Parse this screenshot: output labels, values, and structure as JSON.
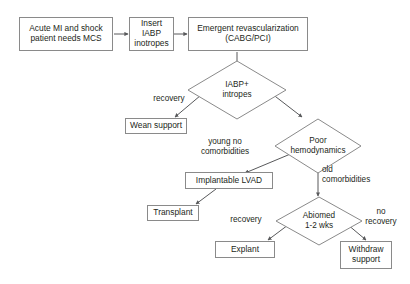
{
  "diagram": {
    "type": "flowchart",
    "colors": {
      "background": "#ffffff",
      "node_border": "#8a8a8a",
      "edge_stroke": "#58595b",
      "text": "#231f20"
    },
    "nodes": {
      "acute_mi": {
        "label": "Acute MI and shock\npatient needs MCS",
        "shape": "box"
      },
      "insert_iabp": {
        "label": "Insert IABP\ninotropes",
        "shape": "box"
      },
      "revascularization": {
        "label": "Emergent revascularization\n(CABG/PCI)",
        "shape": "box"
      },
      "iabp_inotropes_decision": {
        "label": "IABP+\nintropes",
        "shape": "diamond"
      },
      "wean_support": {
        "label": "Wean support",
        "shape": "box"
      },
      "poor_hemodynamics": {
        "label": "Poor\nhemodynamics",
        "shape": "diamond"
      },
      "implantable_lvad": {
        "label": "Implantable LVAD",
        "shape": "box"
      },
      "transplant": {
        "label": "Transplant",
        "shape": "box"
      },
      "abiomed": {
        "label": "Abiomed\n1-2 wks",
        "shape": "diamond"
      },
      "explant": {
        "label": "Explant",
        "shape": "box"
      },
      "withdraw_support": {
        "label": "Withdraw\nsupport",
        "shape": "box"
      }
    },
    "edge_labels": {
      "recovery_wean": "recovery",
      "young_no_comorbidities": "young no\ncomorbidities",
      "old_comorbidities": "old\ncomorbidities",
      "recovery_explant": "recovery",
      "no_recovery": "no\nrecovery"
    },
    "edges": [
      {
        "from": "acute_mi",
        "to": "insert_iabp",
        "label": ""
      },
      {
        "from": "insert_iabp",
        "to": "revascularization",
        "label": ""
      },
      {
        "from": "revascularization",
        "to": "iabp_inotropes_decision",
        "label": ""
      },
      {
        "from": "iabp_inotropes_decision",
        "to": "wean_support",
        "label": "recovery"
      },
      {
        "from": "iabp_inotropes_decision",
        "to": "poor_hemodynamics",
        "label": ""
      },
      {
        "from": "poor_hemodynamics",
        "to": "implantable_lvad",
        "label": "young no comorbidities"
      },
      {
        "from": "implantable_lvad",
        "to": "transplant",
        "label": ""
      },
      {
        "from": "poor_hemodynamics",
        "to": "abiomed",
        "label": "old comorbidities"
      },
      {
        "from": "abiomed",
        "to": "explant",
        "label": "recovery"
      },
      {
        "from": "abiomed",
        "to": "withdraw_support",
        "label": "no recovery"
      }
    ]
  }
}
